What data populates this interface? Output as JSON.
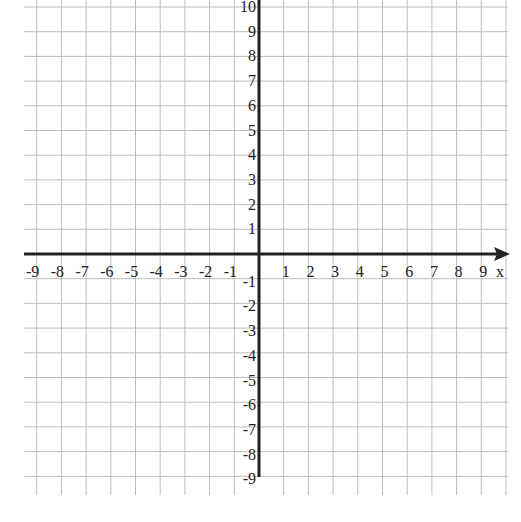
{
  "chart_data": {
    "type": "scatter",
    "title": "",
    "xlabel": "x",
    "ylabel": "",
    "xlim": [
      -9,
      9
    ],
    "ylim": [
      -9,
      10
    ],
    "grid": true,
    "x_tick_labels": [
      "-9",
      "-8",
      "-7",
      "-6",
      "-5",
      "-4",
      "-3",
      "-2",
      "-1",
      "1",
      "2",
      "3",
      "4",
      "5",
      "6",
      "7",
      "8",
      "9"
    ],
    "y_tick_labels": [
      "10",
      "9",
      "8",
      "7",
      "6",
      "5",
      "4",
      "3",
      "2",
      "1",
      "-1",
      "-2",
      "-3",
      "-4",
      "-5",
      "-6",
      "-7",
      "-8",
      "-9"
    ],
    "x": [],
    "y": [],
    "series": []
  },
  "axes": {
    "x_axis_label": "x",
    "x_arrow": "right-arrow",
    "origin_px": [
      259,
      254
    ],
    "unit_px": 24.7
  },
  "colors": {
    "grid": "#bdbdbd",
    "axis": "#222222",
    "text": "#222222",
    "background": "#ffffff"
  }
}
